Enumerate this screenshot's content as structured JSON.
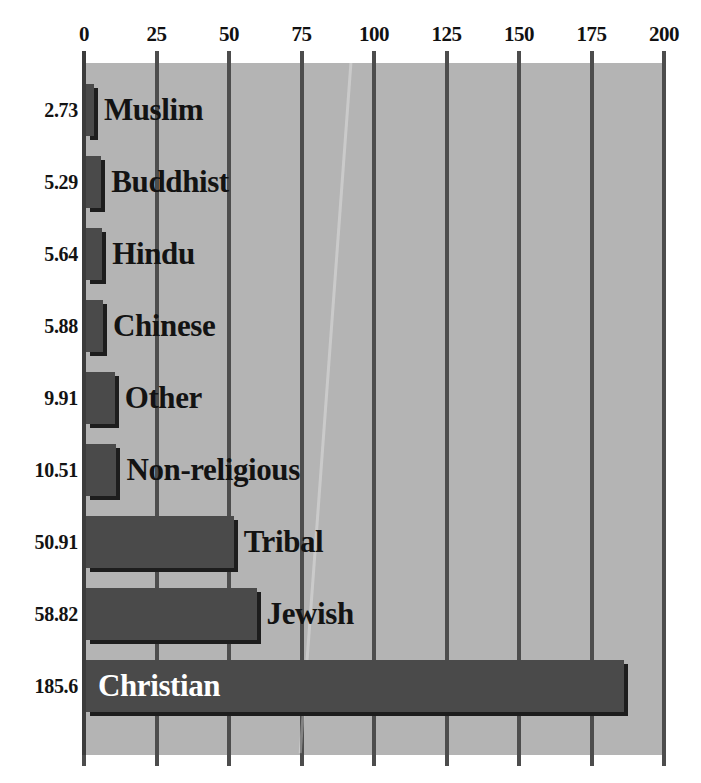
{
  "chart_data": {
    "type": "bar",
    "orientation": "horizontal",
    "title": "",
    "subtitle": "",
    "xlabel": "",
    "ylabel": "",
    "xlim": [
      0,
      200
    ],
    "grid": true,
    "legend": null,
    "tick_labels": [
      "0",
      "25",
      "50",
      "75",
      "100",
      "125",
      "150",
      "175",
      "200"
    ],
    "tick_values": [
      0,
      25,
      50,
      75,
      100,
      125,
      150,
      175,
      200
    ],
    "categories": [
      "Muslim",
      "Buddhist",
      "Hindu",
      "Chinese",
      "Other",
      "Non-religious",
      "Tribal",
      "Jewish",
      "Christian"
    ],
    "values": [
      2.73,
      5.29,
      5.64,
      5.88,
      9.91,
      10.51,
      50.91,
      58.82,
      185.6
    ],
    "value_labels": [
      "2.73",
      "5.29",
      "5.64",
      "5.88",
      "9.91",
      "10.51",
      "50.91",
      "58.82",
      "185.6"
    ],
    "bars": [
      {
        "label": "Muslim",
        "value": 2.73,
        "value_label": "2.73",
        "label_placement": "outside"
      },
      {
        "label": "Buddhist",
        "value": 5.29,
        "value_label": "5.29",
        "label_placement": "outside"
      },
      {
        "label": "Hindu",
        "value": 5.64,
        "value_label": "5.64",
        "label_placement": "outside"
      },
      {
        "label": "Chinese",
        "value": 5.88,
        "value_label": "5.88",
        "label_placement": "outside"
      },
      {
        "label": "Other",
        "value": 9.91,
        "value_label": "9.91",
        "label_placement": "outside"
      },
      {
        "label": "Non-religious",
        "value": 10.51,
        "value_label": "10.51",
        "label_placement": "outside"
      },
      {
        "label": "Tribal",
        "value": 50.91,
        "value_label": "50.91",
        "label_placement": "outside"
      },
      {
        "label": "Jewish",
        "value": 58.82,
        "value_label": "58.82",
        "label_placement": "outside"
      },
      {
        "label": "Christian",
        "value": 185.6,
        "value_label": "185.6",
        "label_placement": "inside"
      }
    ],
    "colors": {
      "bar_fill": "#4a4a4a",
      "bar_shadow": "#1d1d1d",
      "plot_background": "#b4b4b4",
      "gridline": "#4d4d4d",
      "page_background": "#ffffff",
      "text": "#131313",
      "inside_label_text": "#ffffff"
    }
  }
}
